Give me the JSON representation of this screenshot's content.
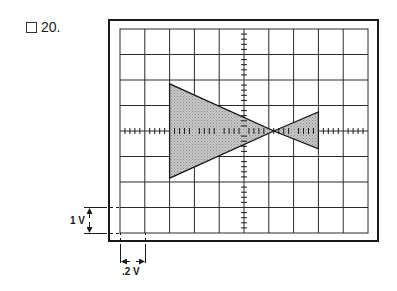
{
  "question": {
    "number_label": "20.",
    "checkbox_checked": false
  },
  "oscilloscope": {
    "grid": {
      "columns": 10,
      "rows": 8,
      "minor_ticks_per_division": 5
    },
    "frame": {
      "left": 109,
      "top": 20,
      "right": 378,
      "bottom": 241
    },
    "screen": {
      "left": 120,
      "top": 29,
      "right": 368,
      "bottom": 233
    },
    "colors": {
      "line": "#1a1a1a",
      "grid": "#2a2a2a",
      "fill": "#bdbdbd"
    },
    "trace": {
      "description": "Bow-tie shaped waveform: two shaded triangles meeting at a point right of center",
      "left_triangle": [
        [
          2.0,
          2.15
        ],
        [
          2.0,
          5.85
        ],
        [
          6.2,
          4.0
        ]
      ],
      "right_triangle": [
        [
          6.2,
          4.0
        ],
        [
          8.0,
          3.25
        ],
        [
          8.0,
          4.7
        ]
      ]
    }
  },
  "scale": {
    "vertical_label": "1 V",
    "horizontal_label": ".2 V"
  }
}
